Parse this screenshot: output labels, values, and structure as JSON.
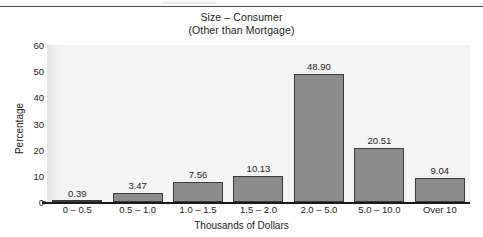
{
  "figure": {
    "width": 483,
    "height": 237,
    "background_color": "#ffffff",
    "plot_background_color": "#f4f4f4",
    "bar_fill_color": "#8c8c8c",
    "bar_border_color": "#3a3a3a",
    "axis_color": "#1a1a1a",
    "text_color": "#1c1c1c"
  },
  "chart_data": {
    "type": "bar",
    "title": "Size – Consumer",
    "subtitle": "(Other than Mortgage)",
    "xlabel": "Thousands of Dollars",
    "ylabel": "Percentage",
    "categories": [
      "0 – 0.5",
      "0.5 – 1.0",
      "1.0 – 1.5",
      "1.5 – 2.0",
      "2.0 – 5.0",
      "5.0 – 10.0",
      "Over 10"
    ],
    "values": [
      0.39,
      3.47,
      7.56,
      10.13,
      48.9,
      20.51,
      9.04
    ],
    "value_labels": [
      "0.39",
      "3.47",
      "7.56",
      "10.13",
      "48.90",
      "20.51",
      "9.04"
    ],
    "ylim": [
      0,
      60
    ],
    "yticks": [
      0,
      10,
      20,
      30,
      40,
      50,
      60
    ],
    "ytick_labels": [
      "0",
      "10",
      "20",
      "30",
      "40",
      "50",
      "60"
    ],
    "grid": false,
    "legend": false,
    "legend_position": "none"
  }
}
